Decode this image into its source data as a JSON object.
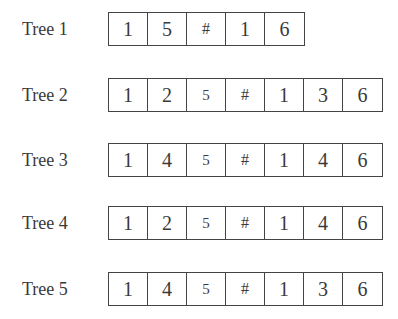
{
  "trees": [
    {
      "label": "Tree 1",
      "top": 12,
      "cells": [
        "1",
        "5",
        "#",
        "1",
        "6"
      ]
    },
    {
      "label": "Tree 2",
      "top": 78,
      "cells": [
        "1",
        "2",
        "5",
        "#",
        "1",
        "3",
        "6"
      ]
    },
    {
      "label": "Tree 3",
      "top": 143,
      "cells": [
        "1",
        "4",
        "5",
        "#",
        "1",
        "4",
        "6"
      ]
    },
    {
      "label": "Tree 4",
      "top": 206,
      "cells": [
        "1",
        "2",
        "5",
        "#",
        "1",
        "4",
        "6"
      ]
    },
    {
      "label": "Tree 5",
      "top": 272,
      "cells": [
        "1",
        "4",
        "5",
        "#",
        "1",
        "3",
        "6"
      ]
    }
  ]
}
